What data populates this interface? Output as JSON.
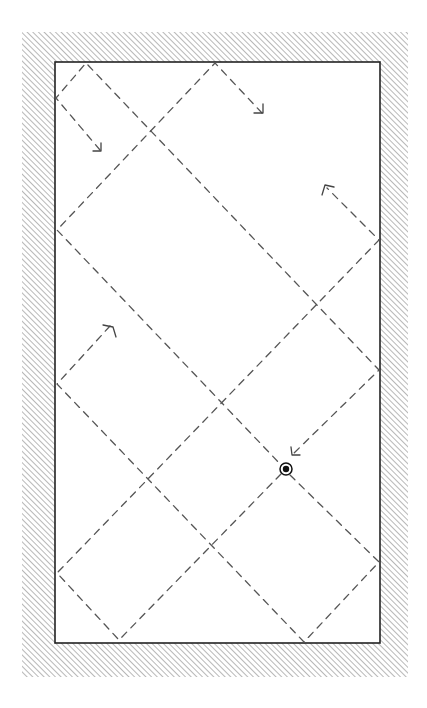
{
  "diagram": {
    "colors": {
      "background": "#ffffff",
      "hatch": "#8a8a8a",
      "wall_edge": "#222222",
      "path": "#555555",
      "ball": "#111111"
    },
    "frame": {
      "outer": {
        "x": 22,
        "y": 32,
        "width": 386,
        "height": 645
      },
      "inner": {
        "x": 55,
        "y": 62,
        "width": 325,
        "height": 581
      }
    },
    "ball": {
      "x": 286,
      "y": 469,
      "r_outer": 6,
      "r_inner": 3.2
    },
    "paths": [
      {
        "id": "top-left-corner-path",
        "points": [
          [
            100,
            150
          ],
          [
            56,
            98
          ],
          [
            86,
            63
          ],
          [
            379,
            370
          ],
          [
            292,
            455
          ]
        ],
        "arrow_at_end": true
      },
      {
        "id": "left-upper-path",
        "points": [
          [
            262,
            113
          ],
          [
            215,
            63
          ],
          [
            57,
            230
          ],
          [
            282,
            466
          ]
        ],
        "arrow_at_end": false
      },
      {
        "id": "left-middle-path",
        "points": [
          [
            110,
            326
          ],
          [
            57,
            384
          ],
          [
            304,
            642
          ],
          [
            379,
            562
          ],
          [
            290,
            475
          ]
        ],
        "arrow_at_end": false
      },
      {
        "id": "bottom-left-path",
        "points": [
          [
            281,
            474
          ],
          [
            119,
            640
          ],
          [
            57,
            573
          ],
          [
            379,
            240
          ],
          [
            327,
            188
          ]
        ],
        "arrow_at_end": true
      }
    ],
    "arrowheads": [
      {
        "id": "arrow-down-right-upper-left",
        "tip": [
          101,
          151
        ],
        "dir": "down-right"
      },
      {
        "id": "arrow-down-right-top",
        "tip": [
          263,
          113
        ],
        "dir": "down-right"
      },
      {
        "id": "arrow-up-left-right",
        "tip": [
          325,
          185
        ],
        "dir": "up-left"
      },
      {
        "id": "arrow-up-right-left",
        "tip": [
          113,
          327
        ],
        "dir": "up-right"
      },
      {
        "id": "arrow-down-left-ball",
        "tip": [
          292,
          455
        ],
        "dir": "down-left"
      }
    ]
  }
}
